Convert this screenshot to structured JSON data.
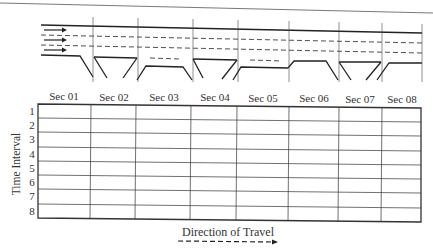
{
  "figure": {
    "roadway": {
      "lanes": 3,
      "flow_arrows": [
        "lane-1-arrow",
        "lane-2-arrow",
        "lane-3-arrow"
      ],
      "section_boundaries_x": [
        93,
        138,
        193,
        238,
        289,
        339,
        382,
        422
      ]
    },
    "grid": {
      "column_headers": [
        "Sec 01",
        "Sec 02",
        "Sec 03",
        "Sec 04",
        "Sec 05",
        "Sec 06",
        "Sec 07",
        "Sec 08"
      ],
      "row_labels": [
        "1",
        "2",
        "3",
        "4",
        "5",
        "6",
        "7",
        "8"
      ],
      "y_axis_label": "Time Interval"
    },
    "direction": {
      "label": "Direction of Travel",
      "icon": "dashed-arrow-right"
    }
  }
}
